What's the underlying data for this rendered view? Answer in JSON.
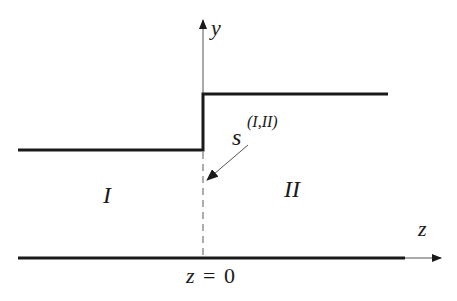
{
  "diagram": {
    "type": "step-interface",
    "axes": {
      "vertical_label": "y",
      "horizontal_label": "z"
    },
    "regions": {
      "left": "I",
      "right": "II"
    },
    "interface": {
      "symbol": "s",
      "superscript": "(I,II)",
      "position_label_lhs": "z",
      "position_label_eq": "=",
      "position_label_rhs": "0"
    },
    "colors": {
      "line": "#1a1a1a",
      "thin_line": "#555555",
      "dashed": "#777777"
    }
  }
}
